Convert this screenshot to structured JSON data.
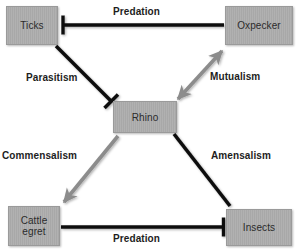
{
  "diagram": {
    "canvas": {
      "width": 300,
      "height": 252,
      "background": "#ffffff"
    },
    "palette": {
      "node_fill": "#a8a8a8",
      "node_border": "#9a9a9a",
      "node_text": "#2b2b2b",
      "label_text": "#1d1d1d",
      "edge_black": "#0f0f0f",
      "edge_gray": "#8c8c8c"
    },
    "nodes": [
      {
        "id": "ticks",
        "label": "Ticks"
      },
      {
        "id": "oxpecker",
        "label": "Oxpecker"
      },
      {
        "id": "rhino",
        "label": "Rhino"
      },
      {
        "id": "cattle_egret",
        "label": "Cattle\negret"
      },
      {
        "id": "insects",
        "label": "Insects"
      }
    ],
    "edges": [
      {
        "id": "predation_top",
        "label": "Predation",
        "from": "oxpecker",
        "to": "ticks",
        "color": "#0f0f0f",
        "head": "bar",
        "head_at": "ticks"
      },
      {
        "id": "parasitism",
        "label": "Parasitism",
        "from": "ticks",
        "to": "rhino",
        "color": "#0f0f0f",
        "head": "bar",
        "head_at": "rhino"
      },
      {
        "id": "mutualism",
        "label": "Mutualism",
        "from": "rhino",
        "to": "oxpecker",
        "color": "#8c8c8c",
        "head": "double-arrow",
        "head_at": "both"
      },
      {
        "id": "commensalism",
        "label": "Commensalism",
        "from": "rhino",
        "to": "cattle_egret",
        "color": "#8c8c8c",
        "head": "arrow",
        "head_at": "cattle_egret"
      },
      {
        "id": "amensalism",
        "label": "Amensalism",
        "from": "rhino",
        "to": "insects",
        "color": "#0f0f0f",
        "head": "none",
        "head_at": "none"
      },
      {
        "id": "predation_bottom",
        "label": "Predation",
        "from": "cattle_egret",
        "to": "insects",
        "color": "#0f0f0f",
        "head": "bar",
        "head_at": "insects"
      }
    ]
  }
}
